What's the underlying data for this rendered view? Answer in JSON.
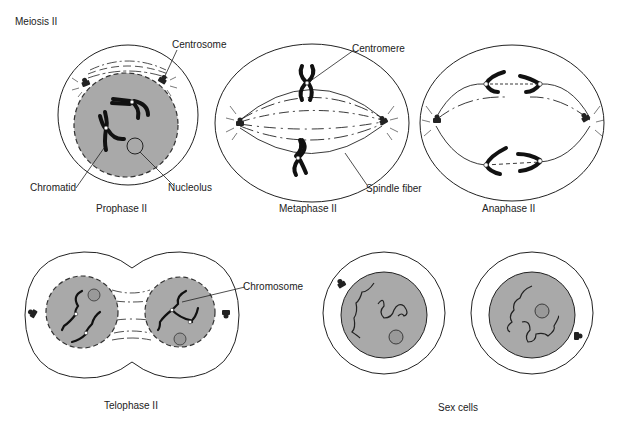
{
  "header": {
    "title": "Meiosis II"
  },
  "colors": {
    "nucleus_fill": "#a9a9a9",
    "nucleolus_fill": "#999999",
    "line": "#222222",
    "chromosome": "#111111",
    "background": "#ffffff"
  },
  "stages": [
    {
      "id": "prophase",
      "label": "Prophase II",
      "callouts": [
        "Centrosome",
        "Chromatid",
        "Nucleolus"
      ]
    },
    {
      "id": "metaphase",
      "label": "Metaphase II",
      "callouts": [
        "Centromere",
        "Spindle fiber"
      ]
    },
    {
      "id": "anaphase",
      "label": "Anaphase II",
      "callouts": []
    },
    {
      "id": "telophase",
      "label": "Telophase II",
      "callouts": [
        "Chromosome"
      ]
    },
    {
      "id": "sex-cells",
      "label": "Sex cells",
      "callouts": []
    }
  ],
  "callouts": {
    "centrosome": "Centrosome",
    "chromatid": "Chromatid",
    "nucleolus": "Nucleolus",
    "centromere": "Centromere",
    "spindle_fiber": "Spindle fiber",
    "chromosome": "Chromosome"
  },
  "icons": {
    "centrosome": "centrosome-icon",
    "chromosome": "chromosome-icon",
    "nucleolus": "nucleolus-icon"
  }
}
